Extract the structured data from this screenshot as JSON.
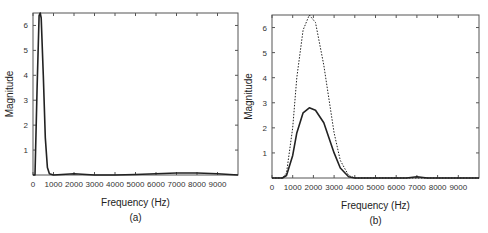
{
  "chart_data": [
    {
      "id": "a",
      "type": "line",
      "caption": "(a)",
      "xlabel": "Frequency (Hz)",
      "ylabel": "Magnitude",
      "xlim": [
        0,
        10000
      ],
      "ylim": [
        0,
        6.5
      ],
      "xticks": [
        "0",
        "1000",
        "2000",
        "3000",
        "4000",
        "5000",
        "6000",
        "7000",
        "8000",
        "9000"
      ],
      "yticks": [
        "1",
        "2",
        "3",
        "4",
        "5",
        "6"
      ],
      "series": [
        {
          "name": "magnitude",
          "style": "solid",
          "x": [
            0,
            100,
            200,
            300,
            350,
            400,
            500,
            600,
            700,
            800,
            1000,
            2000,
            3000,
            4000,
            5000,
            6000,
            7000,
            8000,
            9000,
            10000
          ],
          "y": [
            0,
            0,
            3.5,
            6.4,
            6.5,
            6.3,
            4.0,
            1.5,
            0.3,
            0.05,
            0,
            0.05,
            0,
            0,
            0.02,
            0.05,
            0.08,
            0.08,
            0.05,
            0
          ]
        }
      ]
    },
    {
      "id": "b",
      "type": "line",
      "caption": "(b)",
      "xlabel": "Frequency (Hz)",
      "ylabel": "Magnitude",
      "xlim": [
        0,
        10000
      ],
      "ylim": [
        0,
        6.5
      ],
      "xticks": [
        "0",
        "1000",
        "2000",
        "3000",
        "4000",
        "5000",
        "6000",
        "7000",
        "8000",
        "9000"
      ],
      "yticks": [
        "1",
        "2",
        "3",
        "4",
        "5",
        "6"
      ],
      "series": [
        {
          "name": "solid",
          "style": "solid",
          "x": [
            0,
            500,
            700,
            1000,
            1200,
            1500,
            1800,
            2100,
            2500,
            3000,
            3300,
            3700,
            4000,
            6500,
            7000,
            7500,
            10000
          ],
          "y": [
            0,
            0,
            0.1,
            0.9,
            1.8,
            2.6,
            2.8,
            2.7,
            2.2,
            1.0,
            0.4,
            0.05,
            0,
            0,
            0.05,
            0,
            0
          ]
        },
        {
          "name": "dotted",
          "style": "dotted",
          "x": [
            0,
            500,
            700,
            1000,
            1200,
            1500,
            1800,
            2100,
            2500,
            3000,
            3300,
            3700,
            4000,
            10000
          ],
          "y": [
            0,
            0,
            0.2,
            2.0,
            4.0,
            5.9,
            6.5,
            6.2,
            4.5,
            1.8,
            0.7,
            0.1,
            0,
            0
          ]
        }
      ]
    }
  ]
}
